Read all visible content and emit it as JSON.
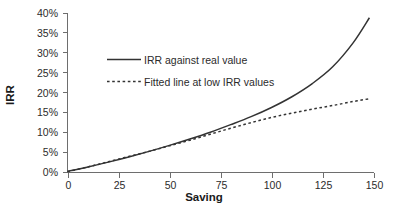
{
  "chart_data": {
    "type": "line",
    "title": "",
    "xlabel": "Saving",
    "ylabel": "IRR",
    "xlim": [
      0,
      150
    ],
    "ylim": [
      0,
      40
    ],
    "grid": false,
    "legend_position": "inside-upper-left",
    "x_ticks": [
      "0",
      "25",
      "50",
      "75",
      "100",
      "125",
      "150"
    ],
    "x_tick_values": [
      0,
      25,
      50,
      75,
      100,
      125,
      150
    ],
    "y_ticks": [
      "0%",
      "5%",
      "10%",
      "15%",
      "20%",
      "25%",
      "30%",
      "35%",
      "40%"
    ],
    "y_tick_values": [
      0,
      5,
      10,
      15,
      20,
      25,
      30,
      35,
      40
    ],
    "series": [
      {
        "name": "IRR against real value",
        "style": "solid",
        "color": "#333333",
        "x": [
          0,
          10,
          20,
          30,
          40,
          50,
          60,
          70,
          80,
          90,
          100,
          110,
          120,
          130,
          140,
          148
        ],
        "values": [
          0.3,
          1.4,
          2.6,
          3.9,
          5.3,
          6.8,
          8.4,
          10.1,
          12.0,
          14.0,
          16.3,
          19.0,
          22.3,
          26.5,
          32.5,
          38.8
        ]
      },
      {
        "name": "Fitted line at low IRR values",
        "style": "dashed",
        "color": "#333333",
        "x": [
          0,
          10,
          20,
          30,
          40,
          50,
          60,
          70,
          80,
          90,
          100,
          110,
          120,
          130,
          140,
          148
        ],
        "values": [
          0.2,
          1.4,
          2.7,
          4.0,
          5.3,
          6.7,
          8.1,
          9.6,
          11.1,
          12.5,
          13.8,
          14.9,
          15.9,
          16.8,
          17.8,
          18.5
        ]
      }
    ]
  },
  "axes": {
    "x_label": "Saving",
    "y_label": "IRR"
  },
  "legend": {
    "items": [
      {
        "label": "IRR against real value",
        "style": "solid"
      },
      {
        "label": "Fitted line at low IRR values",
        "style": "dashed"
      }
    ]
  },
  "colors": {
    "series": "#333333",
    "axis": "#6e6e6e",
    "text": "#2b2b2b",
    "background": "#ffffff"
  }
}
